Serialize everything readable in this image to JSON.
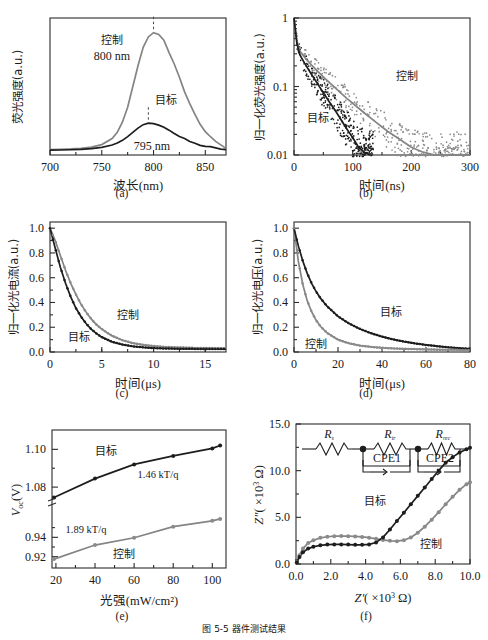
{
  "figure": {
    "caption": "图 5-5  器件测试结果",
    "panel_labels": [
      "(a)",
      "(b)",
      "(c)",
      "(d)",
      "(e)",
      "(f)"
    ],
    "series_names": {
      "control": "控制",
      "target": "目标"
    },
    "colors": {
      "target": "#1d1d1d",
      "control": "#8a8a8a",
      "axis": "#2b2b2b",
      "background": "#ffffff"
    }
  },
  "chart_data": [
    {
      "id": "a",
      "type": "line",
      "panel_label": "(a)",
      "title": "",
      "xlabel": "波长(nm)",
      "ylabel": "荧光强度(a.u.)",
      "xlim": [
        700,
        870
      ],
      "ylim": [
        0,
        1.12
      ],
      "xticks": [
        700,
        750,
        800,
        850
      ],
      "yticks": [],
      "grid": false,
      "legend": "inline-annotations",
      "annotations": [
        {
          "text": "控制",
          "x": 762,
          "y": 0.96
        },
        {
          "text": "800 nm",
          "x": 762,
          "y": 0.86
        },
        {
          "text": "目标",
          "x": 818,
          "y": 0.34
        },
        {
          "text": "795 nm",
          "x": 805,
          "y": 0.12
        }
      ],
      "peak_markers": [
        {
          "series": "控制",
          "x": 800,
          "y": 1.0
        },
        {
          "series": "目标",
          "x": 795,
          "y": 0.26
        }
      ],
      "series": [
        {
          "name": "控制",
          "peak_x": 800,
          "peak_y": 1.0,
          "fwhm": 42,
          "baseline": 0.045,
          "x": [
            700,
            710,
            720,
            730,
            740,
            750,
            760,
            765,
            770,
            775,
            780,
            785,
            790,
            795,
            800,
            805,
            810,
            815,
            820,
            825,
            830,
            835,
            840,
            845,
            850,
            855,
            860,
            865,
            870
          ],
          "values": [
            0.045,
            0.047,
            0.05,
            0.055,
            0.065,
            0.085,
            0.135,
            0.185,
            0.27,
            0.39,
            0.56,
            0.73,
            0.88,
            0.965,
            1.0,
            0.985,
            0.93,
            0.845,
            0.74,
            0.63,
            0.52,
            0.42,
            0.33,
            0.255,
            0.195,
            0.15,
            0.115,
            0.085,
            0.06
          ]
        },
        {
          "name": "目标",
          "peak_x": 795,
          "peak_y": 0.26,
          "fwhm": 46,
          "baseline": 0.04,
          "x": [
            700,
            710,
            720,
            730,
            740,
            750,
            760,
            765,
            770,
            775,
            780,
            785,
            790,
            795,
            800,
            805,
            810,
            815,
            820,
            825,
            830,
            835,
            840,
            845,
            850,
            855,
            860,
            865,
            870
          ],
          "values": [
            0.04,
            0.041,
            0.043,
            0.046,
            0.052,
            0.062,
            0.082,
            0.098,
            0.12,
            0.15,
            0.185,
            0.22,
            0.248,
            0.26,
            0.256,
            0.244,
            0.225,
            0.202,
            0.178,
            0.153,
            0.131,
            0.112,
            0.096,
            0.083,
            0.073,
            0.065,
            0.058,
            0.052,
            0.046
          ]
        }
      ]
    },
    {
      "id": "b",
      "type": "scatter",
      "panel_label": "(b)",
      "xlabel": "时间(ns)",
      "ylabel": "归一化荧光强度(a.u.)",
      "xlim": [
        0,
        300
      ],
      "ylim": [
        0.01,
        1
      ],
      "yscale": "log",
      "xticks": [
        0,
        100,
        200,
        300
      ],
      "yticks": [
        1,
        0.1,
        0.01
      ],
      "ytick_labels": [
        "1",
        "0.1",
        "0.01"
      ],
      "grid": false,
      "annotations": [
        {
          "text": "控制",
          "x": 185,
          "y": 0.12
        },
        {
          "text": "目标",
          "x": 35,
          "y": 0.028
        }
      ],
      "series": [
        {
          "name": "控制",
          "tau_ns": 62,
          "fast_tau_ns": 5,
          "fast_frac": 0.45,
          "x": [
            0,
            5,
            10,
            20,
            30,
            40,
            50,
            60,
            70,
            80,
            90,
            100,
            120,
            140,
            160,
            180,
            200,
            220,
            240,
            260,
            280,
            300
          ],
          "values": [
            1.0,
            0.46,
            0.33,
            0.255,
            0.205,
            0.168,
            0.138,
            0.115,
            0.096,
            0.08,
            0.067,
            0.057,
            0.041,
            0.03,
            0.022,
            0.017,
            0.013,
            0.011,
            0.01,
            0.01,
            0.01,
            0.01
          ]
        },
        {
          "name": "目标",
          "tau_ns": 28,
          "fast_tau_ns": 3.5,
          "fast_frac": 0.55,
          "x": [
            0,
            5,
            10,
            20,
            30,
            40,
            50,
            60,
            70,
            80,
            90,
            100,
            110,
            120,
            130
          ],
          "values": [
            1.0,
            0.42,
            0.29,
            0.205,
            0.15,
            0.11,
            0.081,
            0.06,
            0.045,
            0.033,
            0.024,
            0.018,
            0.013,
            0.011,
            0.01
          ]
        }
      ]
    },
    {
      "id": "c",
      "type": "line",
      "panel_label": "(c)",
      "xlabel": "时间(μs)",
      "ylabel": "归一化光电流(a.u.)",
      "xlim": [
        0,
        17
      ],
      "ylim": [
        0,
        1.05
      ],
      "xticks": [
        0,
        5,
        10,
        15
      ],
      "yticks": [
        0.0,
        0.2,
        0.4,
        0.6,
        0.8,
        1.0
      ],
      "ytick_labels": [
        "0.0",
        "0.2",
        "0.4",
        "0.6",
        "0.8",
        "1.0"
      ],
      "grid": false,
      "annotations": [
        {
          "text": "控制",
          "x": 7.0,
          "y": 0.33
        },
        {
          "text": "目标",
          "x": 2.0,
          "y": 0.1
        }
      ],
      "series": [
        {
          "name": "控制",
          "tau_us": 2.2,
          "x": [
            0,
            0.5,
            1,
            1.5,
            2,
            2.5,
            3,
            3.5,
            4,
            4.5,
            5,
            6,
            7,
            8,
            9,
            10,
            11,
            12,
            13,
            14,
            15,
            16,
            17
          ],
          "values": [
            1.0,
            0.9,
            0.78,
            0.66,
            0.555,
            0.465,
            0.385,
            0.32,
            0.265,
            0.22,
            0.185,
            0.13,
            0.095,
            0.072,
            0.058,
            0.048,
            0.042,
            0.038,
            0.035,
            0.033,
            0.032,
            0.031,
            0.03
          ]
        },
        {
          "name": "目标",
          "tau_us": 1.6,
          "x": [
            0,
            0.5,
            1,
            1.5,
            2,
            2.5,
            3,
            3.5,
            4,
            4.5,
            5,
            6,
            7,
            8,
            9,
            10,
            11,
            12,
            13,
            14,
            15,
            16,
            17
          ],
          "values": [
            1.0,
            0.84,
            0.685,
            0.555,
            0.445,
            0.355,
            0.285,
            0.228,
            0.183,
            0.148,
            0.12,
            0.082,
            0.06,
            0.046,
            0.038,
            0.032,
            0.029,
            0.027,
            0.026,
            0.025,
            0.025,
            0.024,
            0.024
          ]
        }
      ]
    },
    {
      "id": "d",
      "type": "line",
      "panel_label": "(d)",
      "xlabel": "时间(μs)",
      "ylabel": "归一化光电压(a.u.)",
      "xlim": [
        0,
        80
      ],
      "ylim": [
        0,
        1.05
      ],
      "xticks": [
        0,
        20,
        40,
        60,
        80
      ],
      "yticks": [
        0.0,
        0.2,
        0.4,
        0.6,
        0.8,
        1.0
      ],
      "ytick_labels": [
        "0.0",
        "0.2",
        "0.4",
        "0.6",
        "0.8",
        "1.0"
      ],
      "grid": false,
      "annotations": [
        {
          "text": "目标",
          "x": 38,
          "y": 0.3
        },
        {
          "text": "控制",
          "x": 5,
          "y": 0.065
        }
      ],
      "series": [
        {
          "name": "目标",
          "tau_us": 14,
          "x": [
            0,
            2,
            4,
            6,
            8,
            10,
            12,
            15,
            20,
            25,
            30,
            35,
            40,
            45,
            50,
            55,
            60,
            65,
            70,
            75,
            80
          ],
          "values": [
            1.0,
            0.855,
            0.735,
            0.635,
            0.555,
            0.49,
            0.435,
            0.37,
            0.288,
            0.23,
            0.186,
            0.152,
            0.124,
            0.102,
            0.084,
            0.069,
            0.057,
            0.047,
            0.038,
            0.031,
            0.025
          ]
        },
        {
          "name": "控制",
          "tau_us": 6,
          "x": [
            0,
            2,
            4,
            6,
            8,
            10,
            12,
            15,
            20,
            25,
            30,
            35,
            40,
            45,
            50,
            55,
            60,
            65,
            70,
            75,
            80
          ],
          "values": [
            1.0,
            0.73,
            0.545,
            0.415,
            0.325,
            0.258,
            0.208,
            0.155,
            0.1,
            0.07,
            0.052,
            0.041,
            0.034,
            0.029,
            0.026,
            0.023,
            0.021,
            0.019,
            0.018,
            0.017,
            0.016
          ]
        }
      ]
    },
    {
      "id": "e",
      "type": "scatter",
      "panel_label": "(e)",
      "xlabel": "光强(mW/cm²)",
      "ylabel": "V_oc(V)",
      "ylabel_main": "V",
      "ylabel_sub": "oc",
      "ylabel_unit": "(V)",
      "xlim": [
        18,
        107
      ],
      "xticks": [
        20,
        40,
        60,
        80,
        100
      ],
      "yticks_upper": [
        1.1,
        1.08
      ],
      "yticks_lower": [
        0.94,
        0.92
      ],
      "ytick_labels": [
        "1.10",
        "1.08",
        "0.94",
        "0.92"
      ],
      "axis_break": true,
      "grid": false,
      "annotations": [
        {
          "text": "目标",
          "x": 48,
          "y_label": "upper"
        },
        {
          "text": "1.46 kT/q",
          "x": 70,
          "y_label": "upper"
        },
        {
          "text": "1.89 kT/q",
          "x": 38,
          "y_label": "lower"
        },
        {
          "text": "控制",
          "x": 55,
          "y_label": "lower"
        }
      ],
      "series": [
        {
          "name": "目标",
          "ideality_factor": "1.46 kT/q",
          "segment": "upper",
          "x": [
            19,
            40,
            60,
            80,
            100,
            104
          ],
          "values": [
            1.0745,
            1.0845,
            1.092,
            1.0965,
            1.1005,
            1.102
          ]
        },
        {
          "name": "控制",
          "ideality_factor": "1.89 kT/q",
          "segment": "lower",
          "x": [
            19,
            40,
            60,
            80,
            100,
            104
          ],
          "values": [
            0.9175,
            0.932,
            0.9395,
            0.951,
            0.957,
            0.959
          ]
        }
      ]
    },
    {
      "id": "f",
      "type": "scatter",
      "panel_label": "(f)",
      "xlabel": "Z′(×10³ Ω)",
      "ylabel": "Z″(×10³ Ω)",
      "xlabel_sym": "Z'",
      "ylabel_sym": "Z\"",
      "axis_unit": "( ×10",
      "axis_exp": "3",
      "axis_ohm": " Ω)",
      "xlim": [
        0,
        10
      ],
      "ylim": [
        0,
        15
      ],
      "xticks": [
        0.0,
        2.0,
        4.0,
        6.0,
        8.0,
        10.0
      ],
      "xtick_labels": [
        "0.0",
        "2.0",
        "4.0",
        "6.0",
        "8.0",
        "10.0"
      ],
      "yticks": [
        0.0,
        5.0,
        10.0,
        15.0
      ],
      "ytick_labels": [
        "0.0",
        "5.0",
        "10.0",
        "15.0"
      ],
      "grid": false,
      "annotations": [
        {
          "text": "目标",
          "x": 5.4,
          "y": 6.2
        },
        {
          "text": "控制",
          "x": 7.9,
          "y": 2.0
        }
      ],
      "inset_circuit": {
        "name": "equivalent-circuit",
        "elements": [
          "R_s",
          "R_tr",
          "CPE1",
          "R_rec",
          "CPE2"
        ],
        "labels": [
          "R",
          "R",
          "CPE1",
          "R",
          "CPE2"
        ],
        "sub_labels": [
          "s",
          "tr",
          "",
          "rec",
          ""
        ],
        "cpe1": "CPE1",
        "cpe2": "CPE2"
      },
      "series": [
        {
          "name": "目标",
          "x": [
            0.05,
            0.2,
            0.4,
            0.7,
            1.0,
            1.4,
            1.8,
            2.2,
            2.6,
            3.0,
            3.4,
            3.8,
            4.2,
            4.6,
            5.0,
            5.4,
            5.8,
            6.2,
            6.6,
            7.0,
            7.4,
            7.8,
            8.2,
            8.6,
            9.0,
            9.4,
            9.8,
            10.0
          ],
          "values": [
            0.15,
            0.75,
            1.25,
            1.65,
            1.85,
            2.0,
            2.08,
            2.1,
            2.1,
            2.08,
            2.05,
            2.05,
            2.1,
            2.3,
            2.85,
            3.7,
            4.6,
            5.5,
            6.4,
            7.3,
            8.2,
            9.1,
            10.0,
            10.85,
            11.45,
            11.95,
            12.3,
            12.45
          ]
        },
        {
          "name": "控制",
          "x": [
            0.05,
            0.2,
            0.4,
            0.7,
            1.0,
            1.4,
            1.8,
            2.2,
            2.6,
            3.0,
            3.4,
            3.8,
            4.2,
            4.6,
            5.0,
            5.4,
            5.8,
            6.2,
            6.6,
            7.0,
            7.4,
            7.8,
            8.2,
            8.6,
            9.0,
            9.4,
            9.8,
            10.0
          ],
          "values": [
            0.2,
            0.95,
            1.65,
            2.25,
            2.55,
            2.8,
            2.92,
            2.98,
            3.0,
            2.98,
            2.95,
            2.9,
            2.82,
            2.7,
            2.58,
            2.48,
            2.45,
            2.55,
            2.85,
            3.35,
            4.0,
            4.75,
            5.55,
            6.4,
            7.2,
            7.95,
            8.55,
            8.75
          ]
        }
      ]
    }
  ]
}
